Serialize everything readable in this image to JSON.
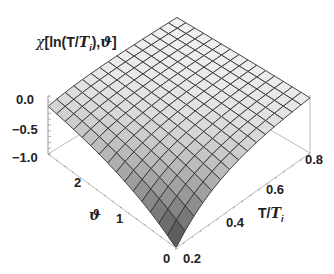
{
  "chart_data": {
    "type": "surface3d",
    "title": "",
    "zlabel": "χ[ln(T/Ti),ϑ]",
    "xlabel": "T/Ti",
    "ylabel": "ϑ",
    "x_range": [
      0.2,
      0.8
    ],
    "y_range": [
      0,
      3.14
    ],
    "z_range": [
      -1.0,
      0.0
    ],
    "x_ticks": [
      "0.2",
      "0.4",
      "0.6",
      "0.8"
    ],
    "y_ticks": [
      "0",
      "1",
      "2"
    ],
    "z_ticks": [
      "0.0",
      "−0.5",
      "−1.0"
    ],
    "mesh": {
      "x_lines": 15,
      "y_lines": 15
    },
    "colors": {
      "surface_light": "#f2f2f2",
      "surface_dark": "#4a4a4a",
      "mesh": "#333333",
      "box": "#bbbbbb",
      "text": "#222222"
    }
  },
  "labels": {
    "zlabel_prefix": "χ[ln(T/",
    "zlabel_T": "T",
    "zlabel_i": "i",
    "zlabel_suffix": "),ϑ]",
    "xlabel_prefix": "T/",
    "xlabel_T": "T",
    "xlabel_i": "i",
    "ylabel": "ϑ"
  }
}
